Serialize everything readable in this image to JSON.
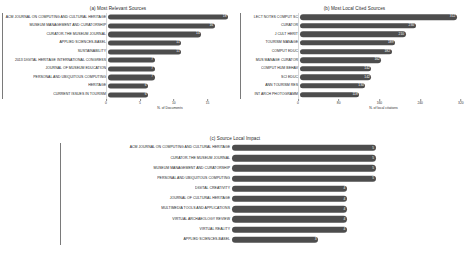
{
  "figure": {
    "background": "#ffffff",
    "bar_color": "#4d4d4d",
    "value_label_color": "#ffffff",
    "grid_color": "#d9d9d9"
  },
  "chart_data": [
    {
      "id": "a",
      "type": "bar",
      "orientation": "horizontal",
      "title": "(a) Most Relevant Sources",
      "xlabel": "N. of Documents",
      "ylabel": "",
      "xlim": [
        0,
        18.9
      ],
      "xticks": [
        0,
        5,
        10,
        15
      ],
      "grid": true,
      "legend": "none",
      "categories": [
        "ACM JOURNAL ON COMPUTING AND CULTURAL HERITAGE",
        "MUSEUM MANAGEMENT AND CURATORSHIP",
        "CURATOR-THE MUSEUM JOURNAL",
        "APPLIED SCIENCES-BASEL",
        "SUSTAINABILITY",
        "2013 DIGITAL HERITAGE INTERNATIONAL CONGRESS",
        "JOURNAL OF MUSEUM EDUCATION",
        "PERSONAL AND UBIQUITOUS COMPUTING",
        "HERITAGE",
        "CURRENT ISSUES IN TOURISM"
      ],
      "values": [
        18,
        16,
        14,
        11,
        11,
        7,
        7,
        7,
        6,
        6
      ]
    },
    {
      "id": "b",
      "type": "bar",
      "orientation": "horizontal",
      "title": "(b) Most Local Cited Sources",
      "xlabel": "N. of local citations",
      "ylabel": "",
      "xlim": [
        0,
        336
      ],
      "xticks": [
        0,
        80,
        160,
        240,
        320
      ],
      "grid": true,
      "legend": "none",
      "categories": [
        "LECT NOTES COMPUT SC",
        "CURATOR",
        "J CULT HERIT",
        "TOURISM MANAGE",
        "COMPUT EDUC",
        "MUS MANAGE CURATOR",
        "COMPUT HUM BEHAV",
        "SCI EDUC",
        "ANN TOURISM RES",
        "INT ARCH PHOTOGRAMM"
      ],
      "values": [
        312,
        230,
        210,
        189,
        182,
        162,
        142,
        142,
        130,
        118
      ]
    },
    {
      "id": "c",
      "type": "bar",
      "orientation": "horizontal",
      "title": "(c) Source Local Impact",
      "xlabel": "",
      "ylabel": "",
      "xlim": [
        0,
        6.2
      ],
      "xticks": [],
      "grid": true,
      "legend": "none",
      "categories": [
        "ACM JOURNAL ON COMPUTING AND CULTURAL HERITAGE",
        "CURATOR-THE MUSEUM JOURNAL",
        "MUSEUM MANAGEMENT AND CURATORSHIP",
        "PERSONAL AND UBIQUITOUS COMPUTING",
        "DIGITAL CREATIVITY",
        "JOURNAL OF CULTURAL HERITAGE",
        "MULTIMEDIA TOOLS AND APPLICATIONS",
        "VIRTUAL ARCHAEOLOGY REVIEW",
        "VIRTUAL REALITY",
        "APPLIED SCIENCES-BASEL"
      ],
      "values": [
        5,
        5,
        5,
        5,
        4,
        4,
        4,
        4,
        4,
        3
      ]
    }
  ]
}
